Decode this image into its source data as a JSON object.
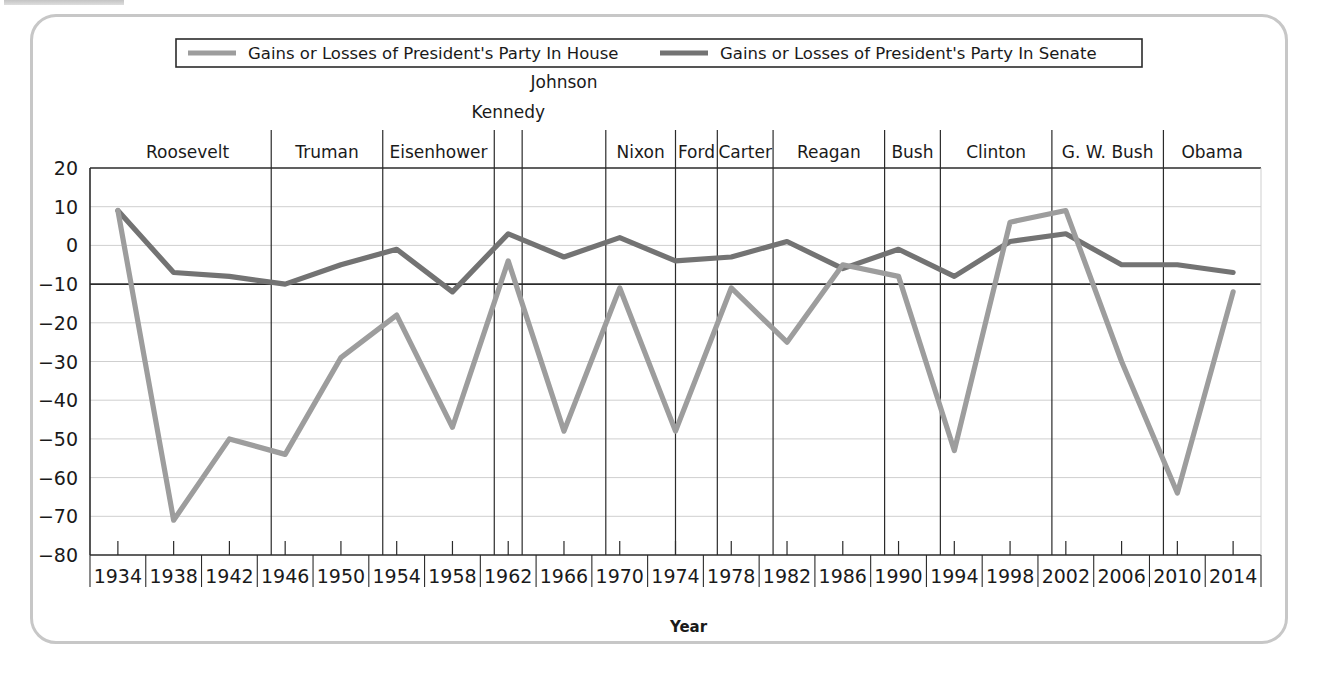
{
  "figure": {
    "axis_title_x": "Year",
    "legend": [
      {
        "label": "Gains or Losses of President's Party In House",
        "color": "#9d9d9d",
        "key": "house"
      },
      {
        "label": "Gains or Losses of President's Party In Senate",
        "color": "#737373",
        "key": "senate"
      }
    ],
    "presidents": [
      {
        "name": "Roosevelt",
        "start": 1933,
        "end": 1945
      },
      {
        "name": "Truman",
        "start": 1945,
        "end": 1953
      },
      {
        "name": "Eisenhower",
        "start": 1953,
        "end": 1961
      },
      {
        "name": "Kennedy",
        "start": 1961,
        "end": 1963
      },
      {
        "name": "Johnson",
        "start": 1963,
        "end": 1969
      },
      {
        "name": "Nixon",
        "start": 1969,
        "end": 1974
      },
      {
        "name": "Ford",
        "start": 1974,
        "end": 1977
      },
      {
        "name": "Carter",
        "start": 1977,
        "end": 1981
      },
      {
        "name": "Reagan",
        "start": 1981,
        "end": 1989
      },
      {
        "name": "Bush",
        "start": 1989,
        "end": 1993
      },
      {
        "name": "Clinton",
        "start": 1993,
        "end": 2001
      },
      {
        "name": "G. W. Bush",
        "start": 2001,
        "end": 2009
      },
      {
        "name": "Obama",
        "start": 2009,
        "end": 2016
      }
    ]
  },
  "chart_data": {
    "type": "line",
    "title": "",
    "xlabel": "Year",
    "ylabel": "",
    "xlim": [
      1932,
      2016
    ],
    "ylim": [
      -80,
      20
    ],
    "ytick_step": 10,
    "grid": true,
    "legend_position": "top",
    "emphasized_gridline": -10,
    "categories": [
      1934,
      1938,
      1942,
      1946,
      1950,
      1954,
      1958,
      1962,
      1966,
      1970,
      1974,
      1978,
      1982,
      1986,
      1990,
      1994,
      1998,
      2002,
      2006,
      2010,
      2014
    ],
    "yticks": [
      20,
      10,
      0,
      -10,
      -20,
      -30,
      -40,
      -50,
      -60,
      -70,
      -80
    ],
    "xtick_labels": [
      "1934",
      "1938",
      "1942",
      "1946",
      "1950",
      "1954",
      "1958",
      "1962",
      "1966",
      "1970",
      "1974",
      "1978",
      "1982",
      "1986",
      "1990",
      "1994",
      "1998",
      "2002",
      "2006",
      "2010",
      "2014"
    ],
    "series": [
      {
        "name": "Gains or Losses of President's Party In House",
        "color": "#9d9d9d",
        "values": [
          9,
          -71,
          -50,
          -54,
          -29,
          -18,
          -47,
          -4,
          -48,
          -11,
          -48,
          -11,
          -25,
          -5,
          -8,
          -53,
          6,
          9,
          -30,
          -64,
          -12
        ]
      },
      {
        "name": "Gains or Losses of President's Party In Senate",
        "color": "#737373",
        "values": [
          9,
          -7,
          -8,
          -10,
          -5,
          -1,
          -12,
          3,
          -3,
          2,
          -4,
          -3,
          1,
          -6,
          -1,
          -8,
          1,
          3,
          -5,
          -5,
          -7
        ]
      }
    ]
  }
}
